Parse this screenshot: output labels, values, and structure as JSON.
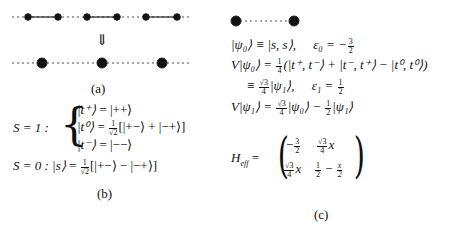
{
  "figure": {
    "panel_a": {
      "caption": "(a)",
      "arrow": "⇓",
      "top_chain": {
        "dimers": 3,
        "sites_per_dimer": 2,
        "bond_style": "solid",
        "interdimer_style": "dashed"
      },
      "bottom_chain": {
        "sites": 3,
        "bond_style": "dashed"
      }
    },
    "panel_b": {
      "caption": "(b)",
      "triplet_label": "S = 1 :",
      "triplet_states": [
        {
          "lhs": "|t⁺⟩",
          "rhs": "= |++⟩"
        },
        {
          "lhs": "|t⁰⟩",
          "rhs_prefix": "=",
          "coef_num": "1",
          "coef_den": "√2",
          "rhs": "[|+−⟩ + |−+⟩]"
        },
        {
          "lhs": "|t⁻⟩",
          "rhs": "= |−−⟩"
        }
      ],
      "singlet_label": "S = 0 :",
      "singlet_state": {
        "lhs": "|s⟩",
        "rhs_prefix": "=",
        "coef_num": "1",
        "coef_den": "√2",
        "rhs": "[|+−⟩ − |−+⟩]"
      }
    },
    "panel_c": {
      "caption": "(c)",
      "pair_diagram": {
        "sites": 2,
        "bond_style": "dashed"
      },
      "lines": [
        {
          "text": "|ψ₀⟩ ≡ |s, s⟩,",
          "eps": "ε₀ = −",
          "eps_num": "3",
          "eps_den": "2"
        },
        {
          "text_prefix": "V|ψ₀⟩ =",
          "coef_num": "1",
          "coef_den": "4",
          "text": "(|t⁺, t⁻⟩ + |t⁻, t⁺⟩ − |t⁰, t⁰⟩)"
        },
        {
          "text_prefix": "≡",
          "coef_num": "√3",
          "coef_den": "4",
          "text": "|ψ₁⟩,",
          "eps": "ε₁ =",
          "eps_num": "1",
          "eps_den": "2"
        },
        {
          "text_prefix": "V|ψ₁⟩ =",
          "coef_num": "√3",
          "coef_den": "4",
          "text": "|ψ₀⟩ −",
          "coef2_num": "1",
          "coef2_den": "2",
          "text2": "|ψ₁⟩"
        }
      ],
      "heff_label": "H",
      "heff_sub": "eff",
      "matrix": [
        [
          {
            "sign": "−",
            "num": "3",
            "den": "2",
            "tail": ""
          },
          {
            "sign": "",
            "num": "√3",
            "den": "4",
            "tail": "x"
          }
        ],
        [
          {
            "sign": "",
            "num": "√3",
            "den": "4",
            "tail": "x"
          },
          {
            "sign": "",
            "num": "1",
            "den": "2",
            "tail": " − ",
            "num2": "x",
            "den2": "2"
          }
        ]
      ]
    }
  }
}
